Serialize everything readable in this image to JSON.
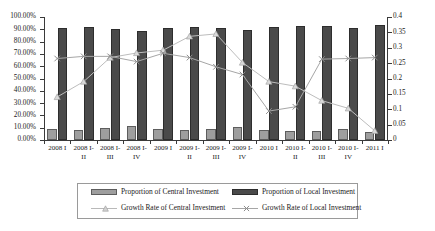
{
  "chart_data": {
    "type": "bar",
    "title": "",
    "xlabel": "",
    "ylabel": "",
    "grid": false,
    "legend_position": "bottom",
    "categories": [
      {
        "line1": "2008 I",
        "line2": ""
      },
      {
        "line1": "2008 I-",
        "line2": "II"
      },
      {
        "line1": "2008 I-",
        "line2": "III"
      },
      {
        "line1": "2008 I-",
        "line2": "IV"
      },
      {
        "line1": "2009 I",
        "line2": ""
      },
      {
        "line1": "2009 I-",
        "line2": "II"
      },
      {
        "line1": "2009 I-",
        "line2": "III"
      },
      {
        "line1": "2009 I-",
        "line2": "IV"
      },
      {
        "line1": "2010 I",
        "line2": ""
      },
      {
        "line1": "2010 I-",
        "line2": "II"
      },
      {
        "line1": "2010 I-",
        "line2": "III"
      },
      {
        "line1": "2010 I-",
        "line2": "IV"
      },
      {
        "line1": "2011 I",
        "line2": ""
      }
    ],
    "left_axis": {
      "label": "",
      "min": 0,
      "max": 1.0,
      "step": 0.1,
      "format": "percent",
      "ticks": [
        "0.00%",
        "10.00%",
        "20.00%",
        "30.00%",
        "40.00%",
        "50.00%",
        "60.00%",
        "70.00%",
        "80.00%",
        "90.00%",
        "100.00%"
      ]
    },
    "right_axis": {
      "label": "",
      "min": 0,
      "max": 0.4,
      "step": 0.05,
      "format": "decimal",
      "ticks": [
        "0",
        "0.05",
        "0.1",
        "0.15",
        "0.2",
        "0.25",
        "0.3",
        "0.35",
        "0.4"
      ]
    },
    "series": [
      {
        "name": "Proportion of Central Investment",
        "kind": "bar",
        "axis": "left",
        "color": "#9e9e9e",
        "values": [
          0.09,
          0.085,
          0.099,
          0.116,
          0.093,
          0.085,
          0.093,
          0.102,
          0.079,
          0.077,
          0.077,
          0.093,
          0.063
        ]
      },
      {
        "name": "Proportion of Local Investment",
        "kind": "bar",
        "axis": "left",
        "color": "#4a4a4a",
        "values": [
          0.91,
          0.915,
          0.901,
          0.884,
          0.907,
          0.915,
          0.907,
          0.898,
          0.921,
          0.923,
          0.923,
          0.907,
          0.937
        ]
      },
      {
        "name": "Growth Rate of Central Investment",
        "kind": "line",
        "axis": "right",
        "color": "#bdbdbd",
        "marker": "triangle",
        "values": [
          0.14,
          0.19,
          0.268,
          0.283,
          0.292,
          0.337,
          0.345,
          0.252,
          0.19,
          0.175,
          0.128,
          0.103,
          0.03
        ]
      },
      {
        "name": "Growth Rate of Local Investment",
        "kind": "line",
        "axis": "right",
        "color": "#a6a6a6",
        "marker": "cross",
        "values": [
          0.265,
          0.272,
          0.272,
          0.255,
          0.282,
          0.268,
          0.238,
          0.213,
          0.094,
          0.108,
          0.263,
          0.265,
          0.268
        ]
      }
    ]
  },
  "legend": {
    "items": [
      {
        "label": "Proportion of Central Investment",
        "type": "swatch",
        "style": "central"
      },
      {
        "label": "Proportion of Local Investment",
        "type": "swatch",
        "style": "local"
      },
      {
        "label": "Growth Rate of Central Investment",
        "type": "line",
        "style": "central-line"
      },
      {
        "label": "Growth Rate of Local Investment",
        "type": "line",
        "style": "local-line"
      }
    ]
  }
}
